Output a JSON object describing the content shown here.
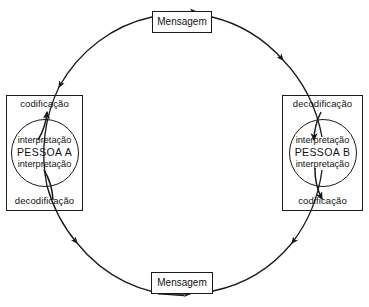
{
  "diagram": {
    "type": "cycle-diagram",
    "stroke_color": "#1a1a1a",
    "background_color": "#ffffff",
    "messages": {
      "top": {
        "label": "Mensagem"
      },
      "bottom": {
        "label": "Mensagem"
      }
    },
    "person_a": {
      "top_stage": "codificação",
      "bottom_stage": "decodificação",
      "interpretation_top": "interpretação",
      "name": "PESSOA A",
      "interpretation_bottom": "interpretação"
    },
    "person_b": {
      "top_stage": "decodificação",
      "bottom_stage": "codificação",
      "interpretation_top": "interpretação",
      "name": "PESSOA B",
      "interpretation_bottom": "interpretação"
    },
    "flow": {
      "direction": "clockwise",
      "arrow_count": 6
    }
  }
}
